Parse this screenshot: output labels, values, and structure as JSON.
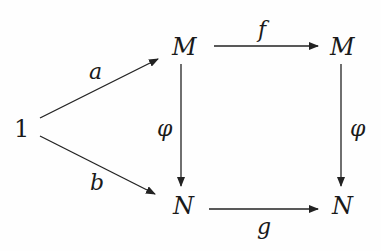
{
  "diagram": {
    "type": "commutative-diagram",
    "nodes": {
      "one": "1",
      "m_left": "M",
      "m_right": "M",
      "n_left": "N",
      "n_right": "N"
    },
    "arrows": {
      "a": {
        "label": "a",
        "from": "1",
        "to": "M (left)"
      },
      "b": {
        "label": "b",
        "from": "1",
        "to": "N (left)"
      },
      "f": {
        "label": "f",
        "from": "M (left)",
        "to": "M (right)"
      },
      "g": {
        "label": "g",
        "from": "N (left)",
        "to": "N (right)"
      },
      "phi_left": {
        "label": "φ",
        "from": "M (left)",
        "to": "N (left)"
      },
      "phi_right": {
        "label": "φ",
        "from": "M (right)",
        "to": "N (right)"
      }
    },
    "colors": {
      "ink": "#1a1a1a",
      "background": "#fefefe"
    }
  }
}
